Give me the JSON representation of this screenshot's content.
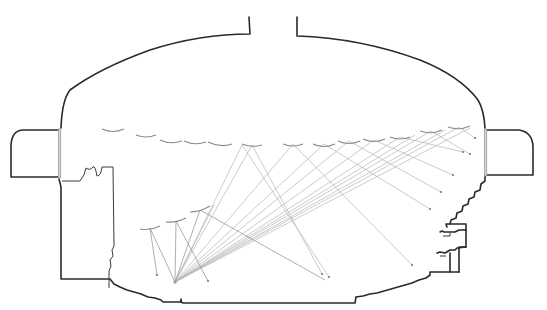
{
  "diagram": {
    "type": "acoustic-ray-tracing-section",
    "colors": {
      "walls": "#2a2a2a",
      "reflectors": "#8a8a8a",
      "rays": "#b4b4b4",
      "glass": "#d8d8d8",
      "background": "#ffffff"
    },
    "source": {
      "x": 175,
      "y": 282
    },
    "reflectors_upper": [
      {
        "x1": 102,
        "x2": 124,
        "y": 129
      },
      {
        "x1": 136,
        "x2": 156,
        "y": 135
      },
      {
        "x1": 160,
        "x2": 182,
        "y": 141
      },
      {
        "x1": 184,
        "x2": 206,
        "y": 142
      },
      {
        "x1": 208,
        "x2": 232,
        "y": 144
      },
      {
        "x1": 242,
        "x2": 262,
        "y": 145
      },
      {
        "x1": 283,
        "x2": 303,
        "y": 144
      },
      {
        "x1": 313,
        "x2": 335,
        "y": 144
      },
      {
        "x1": 338,
        "x2": 360,
        "y": 141
      },
      {
        "x1": 363,
        "x2": 385,
        "y": 140
      },
      {
        "x1": 390,
        "x2": 410,
        "y": 137
      },
      {
        "x1": 420,
        "x2": 442,
        "y": 131
      },
      {
        "x1": 448,
        "x2": 470,
        "y": 127
      }
    ],
    "reflectors_lower": [
      {
        "x1": 140,
        "x2": 160,
        "y": 228
      },
      {
        "x1": 166,
        "x2": 186,
        "y": 221
      },
      {
        "x1": 190,
        "x2": 210,
        "y": 210
      }
    ],
    "rays": [
      {
        "via": [
          252,
          145
        ],
        "to": [
          322,
          274
        ]
      },
      {
        "via": [
          293,
          144
        ],
        "to": [
          412,
          265
        ]
      },
      {
        "via": [
          324,
          144
        ],
        "to": [
          430,
          209
        ]
      },
      {
        "via": [
          349,
          141
        ],
        "to": [
          441,
          192
        ]
      },
      {
        "via": [
          374,
          140
        ],
        "to": [
          453,
          175
        ]
      },
      {
        "via": [
          400,
          137
        ],
        "to": [
          463,
          152
        ]
      },
      {
        "via": [
          431,
          131
        ],
        "to": [
          470,
          154
        ]
      },
      {
        "via": [
          459,
          127
        ],
        "to": [
          475,
          138
        ]
      },
      {
        "via": [
          150,
          228
        ],
        "to": [
          157,
          275
        ]
      },
      {
        "via": [
          176,
          221
        ],
        "to": [
          208,
          281
        ]
      },
      {
        "via": [
          200,
          210
        ],
        "to": [
          325,
          280
        ]
      },
      {
        "via": [
          242,
          145
        ],
        "to": [
          329,
          277
        ]
      }
    ]
  }
}
